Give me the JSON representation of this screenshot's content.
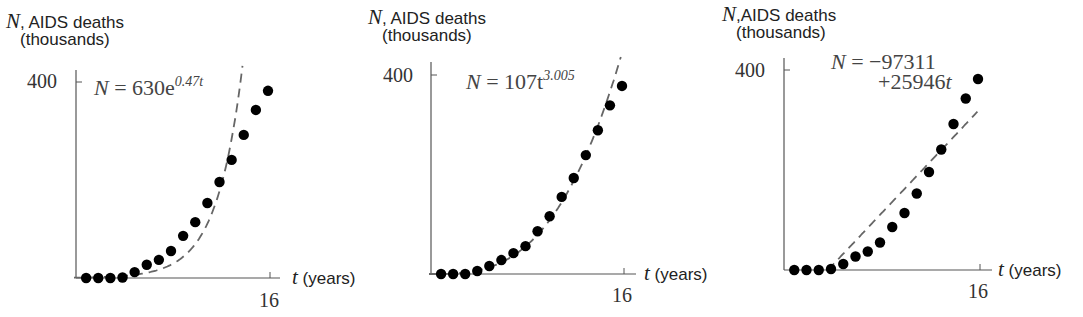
{
  "chart_data": [
    {
      "type": "scatter",
      "title": "",
      "fit_label": "N = 630e^{0.47t}",
      "fit_type": "exponential",
      "fit": {
        "a": 630,
        "b": 0.47
      },
      "xlabel": "t (years)",
      "ylabel": "N, AIDS deaths (thousands)",
      "x_ticks": [
        16
      ],
      "y_ticks": [
        400
      ],
      "xlim": [
        0,
        16
      ],
      "ylim": [
        0,
        400
      ],
      "grid": false,
      "x": [
        1,
        2,
        3,
        4,
        5,
        6,
        7,
        8,
        9,
        10,
        11,
        12,
        13,
        14,
        15,
        16
      ],
      "series": [
        {
          "name": "Data",
          "style": "dots",
          "values": [
            0,
            0,
            0,
            1,
            12,
            27,
            37,
            55,
            86,
            114,
            153,
            196,
            241,
            292,
            343,
            382
          ]
        },
        {
          "name": "Fit",
          "style": "dashed",
          "values": [
            1,
            2,
            3,
            4,
            7,
            11,
            17,
            27,
            43,
            69,
            110,
            176,
            280,
            400,
            400,
            400
          ]
        }
      ]
    },
    {
      "type": "scatter",
      "title": "",
      "fit_label": "N = 107t^{3.005}",
      "fit_type": "power",
      "fit": {
        "a": 107,
        "b": 3.005
      },
      "xlabel": "t (years)",
      "ylabel": "N, AIDS deaths (thousands)",
      "x_ticks": [
        16
      ],
      "y_ticks": [
        400
      ],
      "xlim": [
        0,
        16
      ],
      "ylim": [
        0,
        400
      ],
      "grid": false,
      "x": [
        1,
        2,
        3,
        4,
        5,
        6,
        7,
        8,
        9,
        10,
        11,
        12,
        13,
        14,
        15,
        16
      ],
      "series": [
        {
          "name": "Data",
          "style": "dots",
          "values": [
            0,
            0,
            0,
            6,
            16,
            28,
            42,
            56,
            86,
            116,
            155,
            193,
            239,
            289,
            339,
            378
          ]
        },
        {
          "name": "Fit",
          "style": "dashed",
          "values": [
            0,
            1,
            3,
            7,
            13,
            23,
            37,
            55,
            78,
            107,
            143,
            185,
            235,
            294,
            362,
            439
          ]
        }
      ]
    },
    {
      "type": "scatter",
      "title": "",
      "fit_label": "N = -97311 + 25946t",
      "fit_type": "linear",
      "fit": {
        "intercept": -97311,
        "slope": 25946
      },
      "xlabel": "t (years)",
      "ylabel": "N, AIDS deaths (thousands)",
      "x_ticks": [
        16
      ],
      "y_ticks": [
        400
      ],
      "xlim": [
        0,
        16
      ],
      "ylim": [
        0,
        400
      ],
      "grid": false,
      "x": [
        1,
        2,
        3,
        4,
        5,
        6,
        7,
        8,
        9,
        10,
        11,
        12,
        13,
        14,
        15,
        16
      ],
      "series": [
        {
          "name": "Data",
          "style": "dots",
          "values": [
            0,
            0,
            0,
            2,
            12,
            27,
            37,
            55,
            86,
            114,
            153,
            196,
            241,
            292,
            343,
            382
          ]
        },
        {
          "name": "Fit",
          "style": "dashed",
          "values": [
            null,
            null,
            null,
            6,
            32,
            58,
            84,
            110,
            136,
            162,
            188,
            214,
            240,
            266,
            292,
            318
          ]
        }
      ]
    }
  ],
  "panels": [
    {
      "ylabel_var": "N",
      "ylabel_text": ", AIDS deaths",
      "ylabel_unit": "(thousands)",
      "ytick": "400",
      "xtick": "16",
      "xlabel_var": "t",
      "xlabel_text": " (years)",
      "eq_lhs": "N",
      "eq_rhs": " = 630e",
      "eq_exp": "0.47t"
    },
    {
      "ylabel_var": "N",
      "ylabel_text": ", AIDS deaths",
      "ylabel_unit": "(thousands)",
      "ytick": "400",
      "xtick": "16",
      "xlabel_var": "t",
      "xlabel_text": " (years)",
      "eq_lhs": "N",
      "eq_rhs": " = 107t",
      "eq_exp": "3.005"
    },
    {
      "ylabel_var": "N",
      "ylabel_text": ",AIDS deaths",
      "ylabel_unit": "(thousands)",
      "ytick": "400",
      "xtick": "16",
      "xlabel_var": "t",
      "xlabel_text": " (years)",
      "eq_lhs": "N",
      "eq_line1": " = −97311",
      "eq_line2": "+25946",
      "eq_line2_var": "t"
    }
  ],
  "colors": {
    "dots": "#000000",
    "fit_line": "#666666",
    "axis": "#555555"
  }
}
